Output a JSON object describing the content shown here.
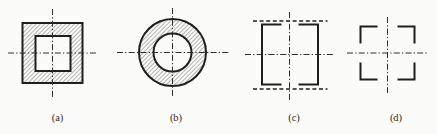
{
  "colors": {
    "bg": "#fbfbf9",
    "line": "#1f1f1f",
    "cline": "#2e2e2e",
    "hatch": "#4a4a4a",
    "label": "#2b2b2b"
  },
  "figures": [
    {
      "name": "hollow-square-section",
      "label": "(a)"
    },
    {
      "name": "hollow-circle-section",
      "label": "(b)"
    },
    {
      "name": "square-dashed-top-bottom",
      "label": "(c)"
    },
    {
      "name": "square-corner-brackets",
      "label": "(d)"
    }
  ]
}
